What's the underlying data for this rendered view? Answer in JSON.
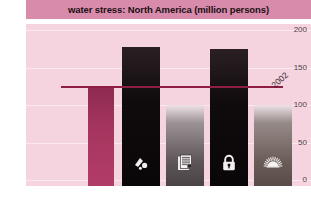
{
  "title": "water stress: North America (million persons)",
  "colors": {
    "title_band": "#d98bac",
    "plot_background": "#f5d3df",
    "gridline": "#fbeaf0",
    "reference_line": "#8e1f42",
    "bar_magenta": "#a6365f",
    "bar_black": "#100b0d",
    "bar_grey": "#5d5558",
    "tick_text": "#4c4246"
  },
  "axis": {
    "tick_labels": [
      "200",
      "150",
      "100",
      "50",
      "0"
    ],
    "min": 0,
    "max": 200,
    "step": 50
  },
  "reference": {
    "label": "2002",
    "value": 125
  },
  "chart_data": {
    "type": "bar",
    "title": "water stress: North America (million persons)",
    "xlabel": "",
    "ylabel": "million persons",
    "ylim": [
      0,
      200
    ],
    "yticks": [
      0,
      50,
      100,
      150,
      200
    ],
    "grid": true,
    "legend": "none",
    "categories": [
      "",
      "",
      "",
      "",
      ""
    ],
    "values": [
      125,
      178,
      100,
      175,
      100
    ],
    "bar_styles": [
      "magenta",
      "black",
      "grey",
      "black",
      "greyb"
    ],
    "bar_icons": [
      "",
      "water-drop-icon",
      "document-icon",
      "padlock-icon",
      "sunburst-icon"
    ],
    "annotations": [
      {
        "type": "hline",
        "label": "2002",
        "value": 125
      }
    ]
  },
  "bars": [
    {
      "value": 125,
      "style": "magenta",
      "icon": "",
      "x": 62,
      "w": 26,
      "name": "bar-1"
    },
    {
      "value": 178,
      "style": "black",
      "icon": "water-drop-icon",
      "x": 96,
      "w": 38,
      "name": "bar-2"
    },
    {
      "value": 100,
      "style": "grey",
      "icon": "document-icon",
      "x": 140,
      "w": 38,
      "name": "bar-3"
    },
    {
      "value": 175,
      "style": "black",
      "icon": "padlock-icon",
      "x": 184,
      "w": 38,
      "name": "bar-4"
    },
    {
      "value": 100,
      "style": "greyb",
      "icon": "sunburst-icon",
      "x": 228,
      "w": 38,
      "name": "bar-5"
    }
  ]
}
